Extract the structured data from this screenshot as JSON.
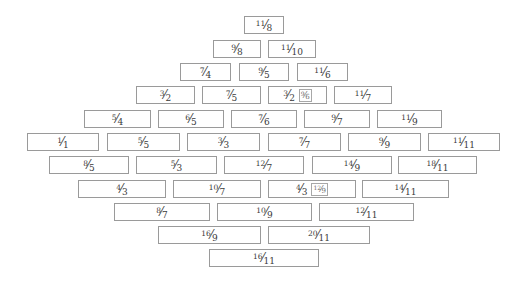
{
  "diagram": {
    "type": "fraction-lattice",
    "colors": {
      "border": "#9a9a9a",
      "text": "#3a3a3a",
      "background": "#ffffff"
    },
    "rows": [
      {
        "y": 16,
        "cells": [
          {
            "num": "11",
            "den": "8",
            "x": 244,
            "w": 40
          }
        ]
      },
      {
        "y": 40,
        "cells": [
          {
            "num": "9",
            "den": "8",
            "x": 213,
            "w": 48
          },
          {
            "num": "11",
            "den": "10",
            "x": 268,
            "w": 48
          }
        ]
      },
      {
        "y": 63,
        "cells": [
          {
            "num": "7",
            "den": "4",
            "x": 180,
            "w": 51
          },
          {
            "num": "9",
            "den": "5",
            "x": 239,
            "w": 50
          },
          {
            "num": "11",
            "den": "6",
            "x": 297,
            "w": 51
          }
        ]
      },
      {
        "y": 86,
        "cells": [
          {
            "num": "3",
            "den": "2",
            "x": 136,
            "w": 59
          },
          {
            "num": "7",
            "den": "5",
            "x": 202,
            "w": 59
          },
          {
            "num": "3",
            "den": "2",
            "x": 268,
            "w": 59,
            "alt_num": "9",
            "alt_den": "6"
          },
          {
            "num": "11",
            "den": "7",
            "x": 334,
            "w": 58
          }
        ]
      },
      {
        "y": 110,
        "cells": [
          {
            "num": "5",
            "den": "4",
            "x": 84,
            "w": 67
          },
          {
            "num": "6",
            "den": "5",
            "x": 158,
            "w": 66
          },
          {
            "num": "7",
            "den": "6",
            "x": 231,
            "w": 66
          },
          {
            "num": "9",
            "den": "7",
            "x": 304,
            "w": 66
          },
          {
            "num": "11",
            "den": "9",
            "x": 377,
            "w": 65
          }
        ]
      },
      {
        "y": 133,
        "cells": [
          {
            "num": "1",
            "den": "1",
            "x": 27,
            "w": 72
          },
          {
            "num": "5",
            "den": "5",
            "x": 107,
            "w": 73
          },
          {
            "num": "3",
            "den": "3",
            "x": 187,
            "w": 73
          },
          {
            "num": "7",
            "den": "7",
            "x": 268,
            "w": 73
          },
          {
            "num": "9",
            "den": "9",
            "x": 348,
            "w": 73
          },
          {
            "num": "11",
            "den": "11",
            "x": 428,
            "w": 72
          }
        ]
      },
      {
        "y": 156,
        "cells": [
          {
            "num": "8",
            "den": "5",
            "x": 49,
            "w": 80
          },
          {
            "num": "5",
            "den": "3",
            "x": 136,
            "w": 81
          },
          {
            "num": "12",
            "den": "7",
            "x": 224,
            "w": 80
          },
          {
            "num": "14",
            "den": "9",
            "x": 312,
            "w": 80
          },
          {
            "num": "18",
            "den": "11",
            "x": 398,
            "w": 79
          }
        ]
      },
      {
        "y": 180,
        "cells": [
          {
            "num": "4",
            "den": "3",
            "x": 78,
            "w": 88
          },
          {
            "num": "10",
            "den": "7",
            "x": 173,
            "w": 88
          },
          {
            "num": "4",
            "den": "3",
            "x": 268,
            "w": 88,
            "alt_num": "12",
            "alt_den": "9"
          },
          {
            "num": "14",
            "den": "11",
            "x": 362,
            "w": 87
          }
        ]
      },
      {
        "y": 203,
        "cells": [
          {
            "num": "8",
            "den": "7",
            "x": 114,
            "w": 96
          },
          {
            "num": "10",
            "den": "9",
            "x": 217,
            "w": 95
          },
          {
            "num": "12",
            "den": "11",
            "x": 319,
            "w": 95
          }
        ]
      },
      {
        "y": 226,
        "cells": [
          {
            "num": "16",
            "den": "9",
            "x": 158,
            "w": 103
          },
          {
            "num": "20",
            "den": "11",
            "x": 268,
            "w": 102
          }
        ]
      },
      {
        "y": 249,
        "cells": [
          {
            "num": "16",
            "den": "11",
            "x": 209,
            "w": 110
          }
        ]
      }
    ]
  }
}
